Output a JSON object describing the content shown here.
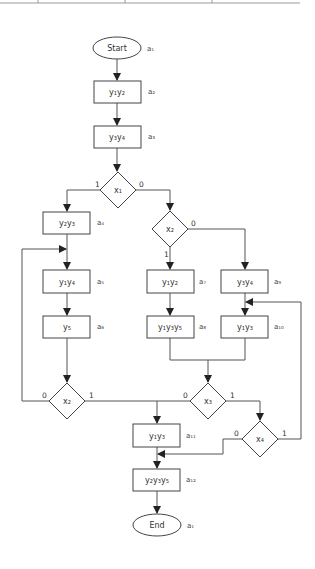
{
  "diagram": {
    "type": "flowchart",
    "nodes": {
      "start": {
        "text": "Start",
        "state": "a₁"
      },
      "op1": {
        "text": "y₁y₂",
        "state": "a₂"
      },
      "op2": {
        "text": "y₃y₄",
        "state": "a₃"
      },
      "cond_x1": {
        "text": "x₁"
      },
      "op3": {
        "text": "y₂y₃",
        "state": "a₄"
      },
      "op4": {
        "text": "y₁y₄",
        "state": "a₅"
      },
      "op5": {
        "text": "y₅",
        "state": "a₆"
      },
      "cond_x2_left": {
        "text": "x₂"
      },
      "cond_x2_right": {
        "text": "x₂"
      },
      "op6": {
        "text": "y₁y₂",
        "state": "a₇"
      },
      "op7": {
        "text": "y₁y₃y₅",
        "state": "a₈"
      },
      "op8": {
        "text": "y₃y₄",
        "state": "a₉"
      },
      "op9": {
        "text": "y₁y₃",
        "state": "a₁₀"
      },
      "cond_x3": {
        "text": "x₃"
      },
      "cond_x4": {
        "text": "x₄"
      },
      "op10": {
        "text": "y₁y₃",
        "state": "a₁₁"
      },
      "op11": {
        "text": "y₂y₃y₅",
        "state": "a₁₂"
      },
      "end": {
        "text": "End",
        "state": "a₁"
      }
    },
    "branch_labels": {
      "x1_true": "1",
      "x1_false": "0",
      "x2r_true": "1",
      "x2r_false": "0",
      "x2l_true": "1",
      "x2l_false": "0",
      "x3_true": "1",
      "x3_false": "0",
      "x4_true": "1",
      "x4_false": "0"
    }
  }
}
